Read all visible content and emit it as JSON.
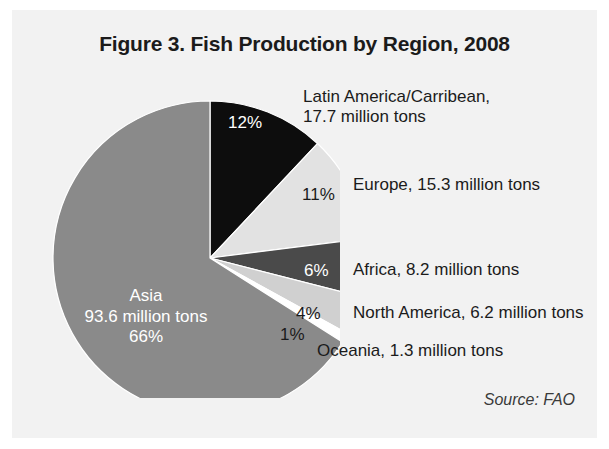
{
  "figure": {
    "title": "Figure 3. Fish Production by Region, 2008",
    "source": "Source: FAO"
  },
  "labels": {
    "latin_america": "Latin America/Carribean,\n17.7 million tons",
    "latin_america_line1": "Latin America/Carribean,",
    "latin_america_line2": "17.7 million tons",
    "europe": "Europe, 15.3 million tons",
    "africa": "Africa, 8.2 million tons",
    "north_america": "North America, 6.2 million tons",
    "oceania": "Oceania, 1.3 million tons",
    "asia_name": "Asia",
    "asia_value": "93.6 million tons",
    "asia_pct": "66%"
  },
  "percent_labels": {
    "latin_america": "12%",
    "europe": "11%",
    "africa": "6%",
    "north_america": "4%",
    "oceania": "1%"
  },
  "colors": {
    "background": "#ffffff",
    "panel": "#f2f2f2",
    "asia": "#8a8a8a",
    "latin_america": "#0d0d0d",
    "europe": "#e2e2e2",
    "africa": "#4a4a4a",
    "north_america": "#d0d0d0",
    "oceania": "#ffffff",
    "text": "#1b1b1b",
    "text_inverse": "#ffffff"
  },
  "chart_data": {
    "type": "pie",
    "title": "Figure 3. Fish Production by Region, 2008",
    "unit": "million tons",
    "value_label": "Production",
    "legend_position": "right",
    "grid": false,
    "total": 142.3,
    "categories": [
      "Asia",
      "Latin America/Carribean",
      "Europe",
      "Africa",
      "North America",
      "Oceania"
    ],
    "values": [
      93.6,
      17.7,
      15.3,
      8.2,
      6.2,
      1.3
    ],
    "percentages": [
      66,
      12,
      11,
      6,
      4,
      1
    ],
    "slices": [
      {
        "name": "Latin America/Carribean",
        "value": 17.7,
        "percent": 12,
        "color": "#0d0d0d",
        "start_angle": 0,
        "end_angle": 43.2
      },
      {
        "name": "Europe",
        "value": 15.3,
        "percent": 11,
        "color": "#e2e2e2",
        "start_angle": 43.2,
        "end_angle": 82.8
      },
      {
        "name": "Africa",
        "value": 8.2,
        "percent": 6,
        "color": "#4a4a4a",
        "start_angle": 82.8,
        "end_angle": 104.4
      },
      {
        "name": "North America",
        "value": 6.2,
        "percent": 4,
        "color": "#d0d0d0",
        "start_angle": 104.4,
        "end_angle": 118.8
      },
      {
        "name": "Oceania",
        "value": 1.3,
        "percent": 1,
        "color": "#ffffff",
        "start_angle": 118.8,
        "end_angle": 122.4
      },
      {
        "name": "Asia",
        "value": 93.6,
        "percent": 66,
        "color": "#8a8a8a",
        "start_angle": 122.4,
        "end_angle": 360
      }
    ],
    "source": "Source: FAO"
  }
}
